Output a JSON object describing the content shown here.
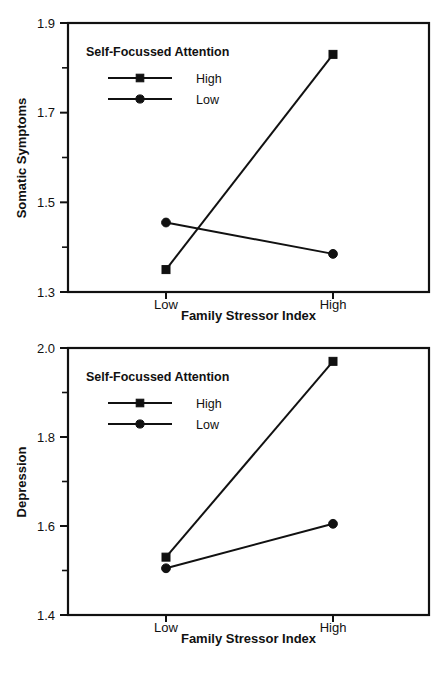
{
  "colors": {
    "ink": "#111111",
    "background": "#ffffff"
  },
  "chart_data": [
    {
      "id": "somatic",
      "type": "line",
      "title": "",
      "xlabel": "Family Stressor Index",
      "ylabel": "Somatic Symptoms",
      "categories": [
        "Low",
        "High"
      ],
      "ylim": [
        1.3,
        1.9
      ],
      "yticks": [
        "1.3",
        "1.5",
        "1.7",
        "1.9"
      ],
      "ytick_values": [
        1.3,
        1.5,
        1.7,
        1.9
      ],
      "yminor_values": [
        1.4,
        1.6,
        1.8
      ],
      "grid": false,
      "legend_position": "upper-left",
      "legend_title": "Self-Focussed Attention",
      "series": [
        {
          "name": "High",
          "marker": "square",
          "values": [
            1.35,
            1.83
          ]
        },
        {
          "name": "Low",
          "marker": "circle",
          "values": [
            1.455,
            1.385
          ]
        }
      ]
    },
    {
      "id": "depression",
      "type": "line",
      "title": "",
      "xlabel": "Family Stressor Index",
      "ylabel": "Depression",
      "categories": [
        "Low",
        "High"
      ],
      "ylim": [
        1.4,
        2.0
      ],
      "yticks": [
        "1.4",
        "1.6",
        "1.8",
        "2.0"
      ],
      "ytick_values": [
        1.4,
        1.6,
        1.8,
        2.0
      ],
      "yminor_values": [
        1.5,
        1.7,
        1.9
      ],
      "grid": false,
      "legend_position": "upper-left",
      "legend_title": "Self-Focussed Attention",
      "series": [
        {
          "name": "High",
          "marker": "square",
          "values": [
            1.53,
            1.97
          ]
        },
        {
          "name": "Low",
          "marker": "circle",
          "values": [
            1.505,
            1.605
          ]
        }
      ]
    }
  ]
}
